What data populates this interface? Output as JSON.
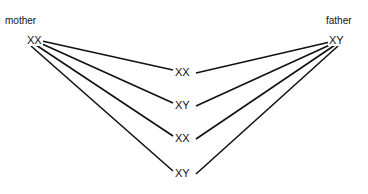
{
  "parents": {
    "mother": {
      "label": "mother",
      "genotype": "XX"
    },
    "father": {
      "label": "father",
      "genotype": "XY"
    }
  },
  "offspring": [
    {
      "genotype": "XX"
    },
    {
      "genotype": "XY"
    },
    {
      "genotype": "XX"
    },
    {
      "genotype": "XY"
    }
  ]
}
